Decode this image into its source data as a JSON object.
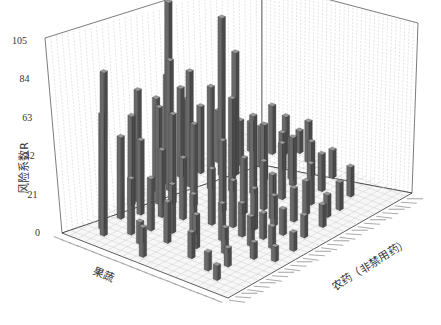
{
  "chart_data": {
    "type": "bar3d",
    "title": "",
    "ylabel": "风险系数R",
    "xlabel": "农药（非禁用药）",
    "zlabel": "果蔬",
    "y_ticks": [
      0,
      21,
      42,
      63,
      84,
      105
    ],
    "ylim": [
      0,
      105
    ],
    "grid": true,
    "legend": null,
    "n_x": 30,
    "n_z": 22,
    "bars": [
      {
        "x": 2,
        "z": 3,
        "value": 8
      },
      {
        "x": 3,
        "z": 5,
        "value": 10
      },
      {
        "x": 4,
        "z": 8,
        "value": 14
      },
      {
        "x": 1,
        "z": 12,
        "value": 16
      },
      {
        "x": 3,
        "z": 14,
        "value": 12
      },
      {
        "x": 2,
        "z": 18,
        "value": 88
      },
      {
        "x": 3,
        "z": 19,
        "value": 62
      },
      {
        "x": 4,
        "z": 16,
        "value": 30
      },
      {
        "x": 5,
        "z": 12,
        "value": 22
      },
      {
        "x": 6,
        "z": 9,
        "value": 18
      },
      {
        "x": 7,
        "z": 6,
        "value": 14
      },
      {
        "x": 8,
        "z": 3,
        "value": 9
      },
      {
        "x": 9,
        "z": 1,
        "value": 8
      },
      {
        "x": 6,
        "z": 15,
        "value": 28
      },
      {
        "x": 7,
        "z": 13,
        "value": 26
      },
      {
        "x": 8,
        "z": 11,
        "value": 22
      },
      {
        "x": 9,
        "z": 8,
        "value": 20
      },
      {
        "x": 10,
        "z": 5,
        "value": 16
      },
      {
        "x": 11,
        "z": 3,
        "value": 12
      },
      {
        "x": 12,
        "z": 1,
        "value": 10
      },
      {
        "x": 8,
        "z": 18,
        "value": 40
      },
      {
        "x": 9,
        "z": 16,
        "value": 36
      },
      {
        "x": 10,
        "z": 14,
        "value": 33
      },
      {
        "x": 11,
        "z": 11,
        "value": 30
      },
      {
        "x": 12,
        "z": 9,
        "value": 25
      },
      {
        "x": 13,
        "z": 7,
        "value": 22
      },
      {
        "x": 14,
        "z": 4,
        "value": 14
      },
      {
        "x": 15,
        "z": 2,
        "value": 12
      },
      {
        "x": 10,
        "z": 20,
        "value": 60
      },
      {
        "x": 11,
        "z": 18,
        "value": 52
      },
      {
        "x": 12,
        "z": 17,
        "value": 48
      },
      {
        "x": 13,
        "z": 15,
        "value": 44
      },
      {
        "x": 14,
        "z": 12,
        "value": 38
      },
      {
        "x": 15,
        "z": 10,
        "value": 30
      },
      {
        "x": 16,
        "z": 7,
        "value": 24
      },
      {
        "x": 17,
        "z": 5,
        "value": 18
      },
      {
        "x": 18,
        "z": 2,
        "value": 12
      },
      {
        "x": 13,
        "z": 20,
        "value": 50
      },
      {
        "x": 14,
        "z": 19,
        "value": 70
      },
      {
        "x": 15,
        "z": 20,
        "value": 98
      },
      {
        "x": 16,
        "z": 18,
        "value": 62
      },
      {
        "x": 17,
        "z": 16,
        "value": 55
      },
      {
        "x": 18,
        "z": 14,
        "value": 50
      },
      {
        "x": 19,
        "z": 12,
        "value": 42
      },
      {
        "x": 20,
        "z": 9,
        "value": 30
      },
      {
        "x": 21,
        "z": 6,
        "value": 22
      },
      {
        "x": 22,
        "z": 3,
        "value": 15
      },
      {
        "x": 16,
        "z": 21,
        "value": 55
      },
      {
        "x": 17,
        "z": 20,
        "value": 48
      },
      {
        "x": 18,
        "z": 20,
        "value": 40
      },
      {
        "x": 19,
        "z": 19,
        "value": 36
      },
      {
        "x": 20,
        "z": 17,
        "value": 85
      },
      {
        "x": 21,
        "z": 16,
        "value": 66
      },
      {
        "x": 22,
        "z": 13,
        "value": 30
      },
      {
        "x": 23,
        "z": 10,
        "value": 26
      },
      {
        "x": 24,
        "z": 7,
        "value": 20
      },
      {
        "x": 25,
        "z": 4,
        "value": 16
      },
      {
        "x": 22,
        "z": 19,
        "value": 28
      },
      {
        "x": 23,
        "z": 17,
        "value": 24
      },
      {
        "x": 24,
        "z": 15,
        "value": 22
      },
      {
        "x": 25,
        "z": 13,
        "value": 20
      },
      {
        "x": 26,
        "z": 10,
        "value": 18
      },
      {
        "x": 27,
        "z": 8,
        "value": 15
      },
      {
        "x": 26,
        "z": 18,
        "value": 16
      },
      {
        "x": 27,
        "z": 16,
        "value": 26
      },
      {
        "x": 28,
        "z": 15,
        "value": 20
      },
      {
        "x": 28,
        "z": 12,
        "value": 22
      },
      {
        "x": 29,
        "z": 14,
        "value": 12
      },
      {
        "x": 5,
        "z": 4,
        "value": 10
      },
      {
        "x": 12,
        "z": 5,
        "value": 14
      },
      {
        "x": 19,
        "z": 5,
        "value": 18
      },
      {
        "x": 20,
        "z": 3,
        "value": 12
      },
      {
        "x": 24,
        "z": 11,
        "value": 22
      },
      {
        "x": 6,
        "z": 19,
        "value": 44
      },
      {
        "x": 9,
        "z": 20,
        "value": 48
      },
      {
        "x": 11,
        "z": 7,
        "value": 18
      },
      {
        "x": 17,
        "z": 9,
        "value": 26
      },
      {
        "x": 15,
        "z": 6,
        "value": 16
      }
    ]
  }
}
